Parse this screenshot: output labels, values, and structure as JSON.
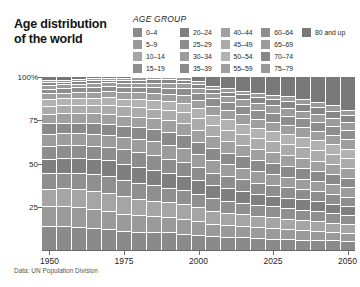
{
  "title": {
    "line1": "Age distribution",
    "line2": "of the world",
    "full": "Age distribution of the world"
  },
  "legend": {
    "heading": "AGE GROUP",
    "columns": [
      [
        {
          "label": "0–4",
          "color": "#8a8a8a"
        },
        {
          "label": "5–9",
          "color": "#9a9a9a"
        },
        {
          "label": "10–14",
          "color": "#a5a5a5"
        },
        {
          "label": "15–19",
          "color": "#8f8f8f"
        }
      ],
      [
        {
          "label": "20–24",
          "color": "#7f7f7f"
        },
        {
          "label": "25–29",
          "color": "#8d8d8d"
        },
        {
          "label": "30–34",
          "color": "#9c9c9c"
        },
        {
          "label": "35–39",
          "color": "#8a8a8a"
        }
      ],
      [
        {
          "label": "40–44",
          "color": "#a0a0a0"
        },
        {
          "label": "45–49",
          "color": "#ababab"
        },
        {
          "label": "50–54",
          "color": "#b2b2b2"
        },
        {
          "label": "55–59",
          "color": "#9e9e9e"
        }
      ],
      [
        {
          "label": "60–64",
          "color": "#8e8e8e"
        },
        {
          "label": "65–69",
          "color": "#9b9b9b"
        },
        {
          "label": "70–74",
          "color": "#868686"
        },
        {
          "label": "75–79",
          "color": "#9a9a9a"
        }
      ],
      [
        {
          "label": "80 and up",
          "color": "#787878"
        }
      ]
    ]
  },
  "source": "Data: UN Population Division",
  "chart_data": {
    "type": "bar",
    "variant": "stacked-100-percent",
    "title": "Age distribution of the world",
    "xlabel": "",
    "ylabel": "",
    "ylim": [
      0,
      100
    ],
    "ytick_labels": [
      "100%",
      "75",
      "50",
      "25"
    ],
    "ytick_values": [
      100,
      75,
      50,
      25
    ],
    "grid": false,
    "legend_position": "top-right",
    "x": [
      1950,
      1955,
      1960,
      1965,
      1970,
      1975,
      1980,
      1985,
      1990,
      1995,
      2000,
      2005,
      2010,
      2015,
      2020,
      2025,
      2030,
      2035,
      2040,
      2045,
      2050
    ],
    "xtick_labels": [
      "1950",
      "1975",
      "2000",
      "2025",
      "2050"
    ],
    "xtick_values": [
      1950,
      1975,
      2000,
      2025,
      2050
    ],
    "series": [
      {
        "name": "0–4",
        "color": "#8a8a8a",
        "values": [
          13.4,
          13.8,
          13.9,
          13.6,
          13.0,
          12.3,
          12.0,
          12.1,
          11.9,
          11.0,
          10.2,
          9.7,
          9.5,
          9.3,
          8.9,
          8.4,
          7.9,
          7.5,
          7.2,
          6.9,
          6.6
        ]
      },
      {
        "name": "5–9",
        "color": "#9a9a9a",
        "values": [
          11.3,
          11.9,
          12.3,
          12.4,
          12.3,
          11.8,
          11.3,
          11.1,
          11.2,
          11.1,
          10.4,
          9.7,
          9.3,
          9.2,
          9.0,
          8.7,
          8.2,
          7.8,
          7.4,
          7.1,
          6.8
        ]
      },
      {
        "name": "10–14",
        "color": "#a5a5a5",
        "values": [
          9.9,
          10.7,
          11.3,
          11.8,
          11.9,
          11.8,
          11.3,
          10.9,
          10.7,
          10.8,
          10.6,
          10.0,
          9.3,
          9.0,
          8.9,
          8.7,
          8.5,
          8.1,
          7.7,
          7.3,
          7.0
        ]
      },
      {
        "name": "15–19",
        "color": "#8f8f8f",
        "values": [
          9.0,
          9.4,
          10.2,
          10.8,
          11.3,
          11.4,
          11.3,
          10.9,
          10.5,
          10.4,
          10.4,
          10.2,
          9.7,
          9.0,
          8.8,
          8.7,
          8.5,
          8.3,
          8.0,
          7.6,
          7.2
        ]
      },
      {
        "name": "20–24",
        "color": "#7f7f7f",
        "values": [
          8.4,
          8.6,
          8.9,
          9.7,
          10.3,
          10.8,
          10.9,
          10.8,
          10.5,
          10.1,
          10.0,
          10.0,
          9.8,
          9.4,
          8.8,
          8.6,
          8.5,
          8.4,
          8.2,
          7.8,
          7.5
        ]
      },
      {
        "name": "25–29",
        "color": "#8d8d8d",
        "values": [
          7.7,
          7.9,
          8.1,
          8.4,
          9.2,
          9.8,
          10.3,
          10.4,
          10.3,
          10.1,
          9.7,
          9.6,
          9.7,
          9.5,
          9.2,
          8.7,
          8.4,
          8.3,
          8.2,
          8.0,
          7.7
        ]
      },
      {
        "name": "30–34",
        "color": "#9c9c9c",
        "values": [
          6.9,
          7.2,
          7.4,
          7.7,
          7.9,
          8.7,
          9.3,
          9.8,
          10.0,
          9.9,
          9.7,
          9.4,
          9.3,
          9.4,
          9.3,
          9.0,
          8.6,
          8.3,
          8.2,
          8.0,
          7.9
        ]
      },
      {
        "name": "35–39",
        "color": "#8a8a8a",
        "values": [
          6.2,
          6.4,
          6.8,
          7.0,
          7.3,
          7.5,
          8.2,
          8.8,
          9.4,
          9.6,
          9.5,
          9.4,
          9.1,
          9.1,
          9.2,
          9.1,
          8.8,
          8.5,
          8.2,
          8.0,
          7.9
        ]
      },
      {
        "name": "40–44",
        "color": "#a0a0a0",
        "values": [
          5.4,
          5.7,
          6.0,
          6.4,
          6.6,
          6.9,
          7.1,
          7.8,
          8.4,
          9.0,
          9.2,
          9.2,
          9.0,
          8.8,
          8.8,
          8.9,
          8.9,
          8.6,
          8.3,
          8.1,
          7.9
        ]
      },
      {
        "name": "45–49",
        "color": "#ababab",
        "values": [
          4.6,
          4.9,
          5.2,
          5.5,
          5.9,
          6.2,
          6.5,
          6.7,
          7.4,
          8.0,
          8.6,
          8.8,
          8.8,
          8.6,
          8.5,
          8.5,
          8.6,
          8.6,
          8.3,
          8.1,
          7.9
        ]
      },
      {
        "name": "50–54",
        "color": "#b2b2b2",
        "values": [
          3.9,
          4.1,
          4.4,
          4.7,
          5.0,
          5.3,
          5.7,
          6.0,
          6.2,
          6.9,
          7.5,
          8.1,
          8.3,
          8.3,
          8.2,
          8.1,
          8.1,
          8.2,
          8.2,
          8.0,
          7.8
        ]
      },
      {
        "name": "55–59",
        "color": "#9e9e9e",
        "values": [
          3.3,
          3.4,
          3.6,
          3.9,
          4.2,
          4.4,
          4.8,
          5.1,
          5.4,
          5.6,
          6.3,
          6.9,
          7.5,
          7.7,
          7.7,
          7.7,
          7.7,
          7.7,
          7.8,
          7.8,
          7.7
        ]
      },
      {
        "name": "60–64",
        "color": "#8e8e8e",
        "values": [
          2.7,
          2.8,
          2.9,
          3.1,
          3.3,
          3.5,
          3.8,
          4.1,
          4.4,
          4.7,
          5.0,
          5.6,
          6.2,
          6.8,
          7.0,
          7.1,
          7.1,
          7.2,
          7.2,
          7.3,
          7.4
        ]
      },
      {
        "name": "65–69",
        "color": "#9b9b9b",
        "values": [
          2.1,
          2.2,
          2.3,
          2.4,
          2.5,
          2.7,
          2.9,
          3.2,
          3.4,
          3.7,
          4.0,
          4.3,
          4.8,
          5.4,
          6.0,
          6.2,
          6.4,
          6.4,
          6.5,
          6.6,
          6.7
        ]
      },
      {
        "name": "70–74",
        "color": "#868686",
        "values": [
          1.6,
          1.6,
          1.7,
          1.8,
          1.9,
          2.0,
          2.1,
          2.3,
          2.5,
          2.7,
          2.9,
          3.2,
          3.5,
          3.9,
          4.5,
          5.0,
          5.3,
          5.4,
          5.5,
          5.6,
          5.7
        ]
      },
      {
        "name": "75–79",
        "color": "#9a9a9a",
        "values": [
          1.0,
          1.1,
          1.1,
          1.2,
          1.3,
          1.4,
          1.5,
          1.6,
          1.8,
          1.9,
          2.1,
          2.3,
          2.5,
          2.8,
          3.1,
          3.6,
          4.0,
          4.3,
          4.4,
          4.5,
          4.6
        ]
      },
      {
        "name": "80 and up",
        "color": "#787878",
        "values": [
          2.6,
          2.3,
          1.9,
          1.6,
          1.1,
          1.5,
          1.0,
          0.4,
          0.0,
          0.5,
          3.9,
          7.6,
          9.7,
          11.8,
          14.1,
          15.0,
          16.5,
          18.2,
          20.7,
          23.8,
          27.7
        ]
      }
    ]
  }
}
